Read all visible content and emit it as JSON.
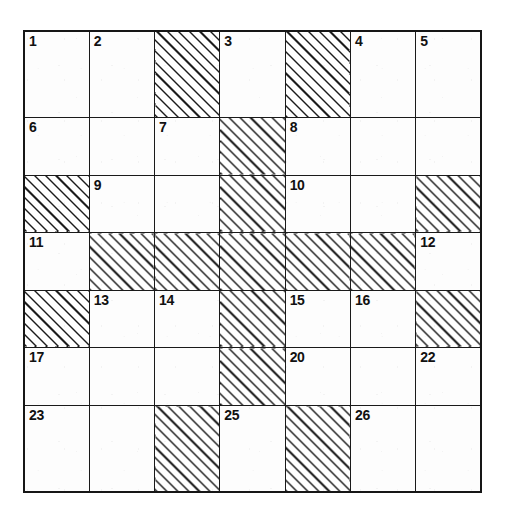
{
  "puzzle": {
    "kind": "crossword-grid",
    "rows": 7,
    "columns": 7,
    "colors": {
      "grid_line": "#1a1a1a",
      "outer_border": "#161616",
      "open_cell_fill": "#fdfdfd",
      "blocked_hatch": "#1c1c1c",
      "number_text": "#111111"
    },
    "legend": {
      "open_cell": "open",
      "blocked_cell": "blocked-hatched"
    },
    "cells": [
      [
        {
          "state": "open",
          "number": "1"
        },
        {
          "state": "open",
          "number": "2"
        },
        {
          "state": "blocked",
          "number": ""
        },
        {
          "state": "open",
          "number": "3"
        },
        {
          "state": "blocked",
          "number": ""
        },
        {
          "state": "open",
          "number": "4"
        },
        {
          "state": "open",
          "number": "5"
        }
      ],
      [
        {
          "state": "open",
          "number": "6"
        },
        {
          "state": "open",
          "number": ""
        },
        {
          "state": "open",
          "number": "7"
        },
        {
          "state": "blocked",
          "number": ""
        },
        {
          "state": "open",
          "number": "8"
        },
        {
          "state": "open",
          "number": ""
        },
        {
          "state": "open",
          "number": ""
        }
      ],
      [
        {
          "state": "blocked",
          "number": ""
        },
        {
          "state": "open",
          "number": "9"
        },
        {
          "state": "open",
          "number": ""
        },
        {
          "state": "blocked",
          "number": ""
        },
        {
          "state": "open",
          "number": "10"
        },
        {
          "state": "open",
          "number": ""
        },
        {
          "state": "blocked",
          "number": ""
        }
      ],
      [
        {
          "state": "open",
          "number": "11"
        },
        {
          "state": "blocked",
          "number": ""
        },
        {
          "state": "blocked",
          "number": ""
        },
        {
          "state": "blocked",
          "number": ""
        },
        {
          "state": "blocked",
          "number": ""
        },
        {
          "state": "blocked",
          "number": ""
        },
        {
          "state": "open",
          "number": "12"
        }
      ],
      [
        {
          "state": "blocked",
          "number": ""
        },
        {
          "state": "open",
          "number": "13"
        },
        {
          "state": "open",
          "number": "14"
        },
        {
          "state": "blocked",
          "number": ""
        },
        {
          "state": "open",
          "number": "15"
        },
        {
          "state": "open",
          "number": "16"
        },
        {
          "state": "blocked",
          "number": ""
        }
      ],
      [
        {
          "state": "open",
          "number": "17"
        },
        {
          "state": "open",
          "number": ""
        },
        {
          "state": "open",
          "number": ""
        },
        {
          "state": "blocked",
          "number": ""
        },
        {
          "state": "open",
          "number": "20"
        },
        {
          "state": "open",
          "number": ""
        },
        {
          "state": "open",
          "number": "22"
        }
      ],
      [
        {
          "state": "open",
          "number": "23"
        },
        {
          "state": "open",
          "number": ""
        },
        {
          "state": "blocked",
          "number": ""
        },
        {
          "state": "open",
          "number": "25"
        },
        {
          "state": "blocked",
          "number": ""
        },
        {
          "state": "open",
          "number": "26"
        },
        {
          "state": "open",
          "number": ""
        }
      ]
    ],
    "numbers_present": [
      "1",
      "2",
      "3",
      "4",
      "5",
      "6",
      "7",
      "8",
      "9",
      "10",
      "11",
      "12",
      "13",
      "14",
      "15",
      "16",
      "17",
      "20",
      "22",
      "23",
      "25",
      "26"
    ]
  }
}
